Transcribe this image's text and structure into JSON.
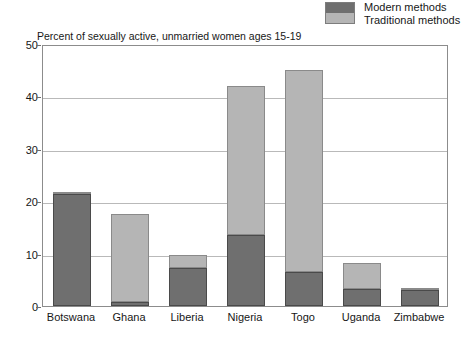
{
  "legend": {
    "swatch_name": "legend-color-swatch",
    "entries": [
      {
        "label": "Modern methods",
        "color": "#6f6f6f"
      },
      {
        "label": "Traditional methods",
        "color": "#b5b5b5"
      }
    ]
  },
  "subtitle": "Percent of sexually active, unmarried women ages 15-19",
  "chart_data": {
    "type": "bar",
    "title": "",
    "subtitle": "Percent of sexually active, unmarried women ages 15-19",
    "xlabel": "",
    "ylabel": "",
    "ylim": [
      0,
      50
    ],
    "yticks": [
      0,
      10,
      20,
      30,
      40,
      50
    ],
    "grid": true,
    "stacked": true,
    "legend_position": "top-right",
    "categories": [
      "Botswana",
      "Ghana",
      "Liberia",
      "Nigeria",
      "Togo",
      "Uganda",
      "Zimbabwe"
    ],
    "series": [
      {
        "name": "Modern methods",
        "color": "#6f6f6f",
        "values": [
          21.3,
          0.8,
          7.2,
          13.5,
          6.5,
          3.3,
          3.0
        ]
      },
      {
        "name": "Traditional methods",
        "color": "#b5b5b5",
        "values": [
          0.4,
          16.7,
          2.6,
          28.5,
          38.5,
          5.0,
          0.2
        ]
      }
    ],
    "totals": [
      21.7,
      17.5,
      9.8,
      42.0,
      45.0,
      8.3,
      3.2
    ]
  }
}
